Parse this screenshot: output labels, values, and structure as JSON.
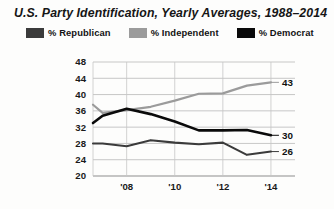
{
  "chart_title": "U.S. Party Identification, Yearly Averages, 1988–2014",
  "legend": {
    "items": [
      {
        "label": "% Republican",
        "color": "#3b3b3b",
        "key": "republican"
      },
      {
        "label": "% Independent",
        "color": "#9b9b9b",
        "key": "independent"
      },
      {
        "label": "% Democrat",
        "color": "#0a0a0a",
        "key": "democrat"
      }
    ]
  },
  "axes": {
    "y_ticks": [
      "48",
      "44",
      "40",
      "36",
      "32",
      "28",
      "24",
      "20"
    ],
    "x_ticks": [
      "'08",
      "'10",
      "'12",
      "'14"
    ]
  },
  "end_labels": {
    "independent": "43",
    "democrat": "30",
    "republican": "26"
  },
  "chart_data": {
    "type": "line",
    "title": "U.S. Party Identification, Yearly Averages, 1988–2014",
    "xlabel": "",
    "ylabel": "",
    "xlim": [
      2006.6,
      2015.0
    ],
    "ylim": [
      20,
      48
    ],
    "grid": true,
    "legend_position": "top",
    "x": [
      2006.6,
      2007,
      2008,
      2009,
      2010,
      2011,
      2012,
      2013,
      2014
    ],
    "x_tick_values": [
      2008,
      2010,
      2012,
      2014
    ],
    "x_tick_labels": [
      "'08",
      "'10",
      "'12",
      "'14"
    ],
    "y_tick_values": [
      48,
      44,
      40,
      36,
      32,
      28,
      24,
      20
    ],
    "y_tick_labels": [
      "48",
      "44",
      "40",
      "36",
      "32",
      "28",
      "24",
      "20"
    ],
    "series": [
      {
        "name": "% Republican",
        "color": "#3b3b3b",
        "values": [
          28.0,
          28.0,
          27.3,
          28.8,
          28.2,
          27.8,
          28.2,
          25.2,
          26.0
        ],
        "end_label": "26"
      },
      {
        "name": "% Independent",
        "color": "#9b9b9b",
        "values": [
          37.5,
          35.5,
          36.2,
          37.0,
          38.5,
          40.2,
          40.3,
          42.2,
          43.0
        ],
        "end_label": "43"
      },
      {
        "name": "% Democrat",
        "color": "#0a0a0a",
        "values": [
          33.0,
          34.8,
          36.5,
          35.2,
          33.4,
          31.2,
          31.2,
          31.3,
          30.0
        ],
        "end_label": "30"
      }
    ]
  }
}
